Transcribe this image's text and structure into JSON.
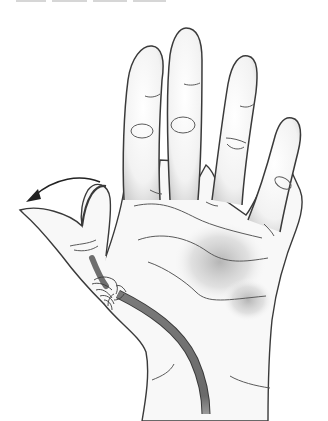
{
  "illustration": {
    "subject": "Palm view of a right hand with the thumb flexed across the palm and a flexor tendon highlighted",
    "caption": "",
    "colors": {
      "outline": "#3a3a3a",
      "skin": "#f7f7f7",
      "shadow": "#b5b5b5",
      "tendon": "#6e6e6e",
      "crease": "#5a5a5a",
      "background": "#ffffff"
    },
    "parts": [
      {
        "name": "index-finger"
      },
      {
        "name": "middle-finger"
      },
      {
        "name": "ring-finger"
      },
      {
        "name": "little-finger"
      },
      {
        "name": "thumb",
        "state": "flexed"
      },
      {
        "name": "tendon",
        "state": "highlighted"
      },
      {
        "name": "motion-arrow",
        "direction": "left"
      }
    ]
  }
}
